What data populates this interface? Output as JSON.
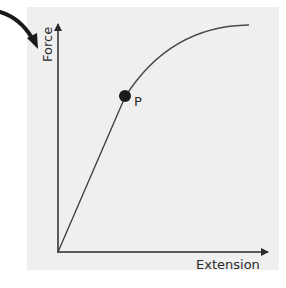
{
  "diagram": {
    "type": "force-extension graph",
    "background_color": "#efefef",
    "line_color": "#3a3a3a",
    "pointer_arrow_color": "#1a1a1a",
    "y_axis_label": "Force",
    "x_axis_label": "Extension",
    "point_label": "P",
    "segments": [
      {
        "name": "linear region",
        "from": "origin",
        "to": "P"
      },
      {
        "name": "curved region",
        "from": "P",
        "to": "plateau"
      }
    ]
  }
}
